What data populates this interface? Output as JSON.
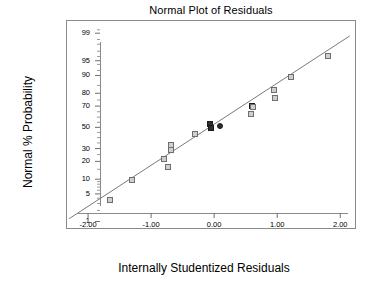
{
  "chart_data": {
    "type": "scatter",
    "title": "Normal Plot of Residuals",
    "xlabel": "Internally Studentized Residuals",
    "ylabel": "Normal % Probability",
    "grid": false,
    "legend": "none",
    "xlim": [
      -2.35,
      2.25
    ],
    "xticks": [
      -2.0,
      -1.0,
      0.0,
      1.0,
      2.0
    ],
    "xticklabels": [
      "-2.00",
      "-1.00",
      "0.00",
      "1.00",
      "2.00"
    ],
    "yscale": "normal-probability",
    "ylim": [
      0.6,
      99.6
    ],
    "yticks": [
      1,
      5,
      10,
      20,
      30,
      50,
      70,
      80,
      90,
      95,
      99
    ],
    "yticklabels": [
      "1",
      "5",
      "10",
      "20",
      "30",
      "50",
      "70",
      "80",
      "90",
      "95",
      "99"
    ],
    "reference_line": {
      "label": "normal reference line",
      "x_start": -2.3,
      "y_start": 1.2,
      "x_end": 2.15,
      "y_end": 98.8,
      "color": "#7a7a7a"
    },
    "series": [
      {
        "name": "Residuals",
        "marker": "square",
        "color": "#cfcfcf",
        "edge_color": "#6e6e6e",
        "points": [
          {
            "x": -1.66,
            "y": 3.6,
            "style": "light"
          },
          {
            "x": -1.31,
            "y": 9.8,
            "style": "light"
          },
          {
            "x": -0.79,
            "y": 22.0,
            "style": "light"
          },
          {
            "x": -0.73,
            "y": 16.5,
            "style": "light"
          },
          {
            "x": -0.69,
            "y": 33.5,
            "style": "light"
          },
          {
            "x": -0.68,
            "y": 28.5,
            "style": "light"
          },
          {
            "x": -0.31,
            "y": 43.0,
            "style": "light"
          },
          {
            "x": -0.06,
            "y": 53.5,
            "style": "dark"
          },
          {
            "x": -0.05,
            "y": 49.5,
            "style": "dark"
          },
          {
            "x": 0.09,
            "y": 51.5,
            "style": "round"
          },
          {
            "x": 0.58,
            "y": 62.5,
            "style": "light"
          },
          {
            "x": 0.6,
            "y": 70.0,
            "style": "dark"
          },
          {
            "x": 0.61,
            "y": 69.5,
            "style": "light"
          },
          {
            "x": 0.95,
            "y": 82.0,
            "style": "light"
          },
          {
            "x": 0.96,
            "y": 76.5,
            "style": "light"
          },
          {
            "x": 1.22,
            "y": 89.5,
            "style": "light"
          },
          {
            "x": 1.81,
            "y": 96.0,
            "style": "light"
          }
        ]
      }
    ]
  }
}
